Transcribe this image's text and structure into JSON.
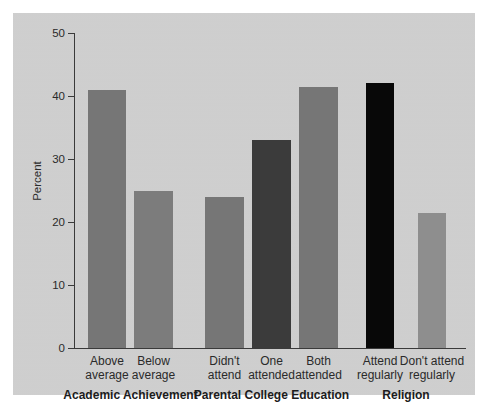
{
  "chart_data": {
    "type": "bar",
    "title": "",
    "subtitle": "",
    "xlabel": "",
    "ylabel": "Percent",
    "ylim": [
      0,
      50
    ],
    "yticks": [
      0,
      10,
      20,
      30,
      40,
      50
    ],
    "ytick_labels": [
      "0",
      "10",
      "20",
      "30",
      "40",
      "50"
    ],
    "grid": false,
    "legend": "none",
    "categories": [
      "Above average",
      "Below average",
      "Didn't attend",
      "One attended",
      "Both attended",
      "Attend regularly",
      "Don't attend regularly"
    ],
    "values": [
      41,
      25,
      24,
      33,
      41.5,
      42,
      21.5
    ],
    "bar_colors": [
      "#767676",
      "#7c7c7c",
      "#767676",
      "#3b3b3b",
      "#767676",
      "#080808",
      "#8e8e8e"
    ],
    "groups": [
      {
        "title": "Academic Achievement",
        "categories": [
          "Above average",
          "Below average"
        ]
      },
      {
        "title": "Parental College Education",
        "categories": [
          "Didn't attend",
          "One attended",
          "Both attended"
        ]
      },
      {
        "title": "Religion",
        "categories": [
          "Attend regularly",
          "Don't attend regularly"
        ]
      }
    ]
  },
  "bars": [
    {
      "label_line1": "Above",
      "label_line2": "average",
      "value": 41,
      "color": "#767676",
      "x": 88,
      "width": 38
    },
    {
      "label_line1": "Below",
      "label_line2": "average",
      "value": 25,
      "color": "#7c7c7c",
      "x": 134,
      "width": 39
    },
    {
      "label_line1": "Didn't",
      "label_line2": "attend",
      "value": 24,
      "color": "#767676",
      "x": 205,
      "width": 39
    },
    {
      "label_line1": "One",
      "label_line2": "attended",
      "value": 33,
      "color": "#3b3b3b",
      "x": 252,
      "width": 39
    },
    {
      "label_line1": "Both",
      "label_line2": "attended",
      "value": 41.5,
      "color": "#767676",
      "x": 299,
      "width": 39
    },
    {
      "label_line1": "Attend",
      "label_line2": "regularly",
      "value": 42,
      "color": "#080808",
      "x": 366,
      "width": 28
    },
    {
      "label_line1": "Don't attend",
      "label_line2": "regularly",
      "value": 21.5,
      "color": "#8e8e8e",
      "x": 418,
      "width": 28
    }
  ],
  "axis": {
    "ylabel": "Percent",
    "ytick_labels": [
      "50",
      "40",
      "30",
      "20",
      "10",
      "0"
    ]
  },
  "group_titles": [
    "Academic Achievement",
    "Parental College Education",
    "Religion"
  ],
  "colors": {
    "panel_background": "#cfcfcf",
    "page_background": "#ffffff",
    "axis": "#3a3a3a",
    "text": "#2a2a2a"
  }
}
